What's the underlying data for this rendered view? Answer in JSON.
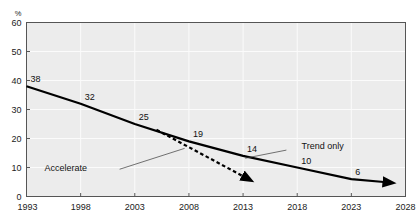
{
  "chart_data": {
    "type": "line",
    "title": "",
    "subtitle": "",
    "xlabel": "",
    "ylabel": "%",
    "ylim": [
      0,
      60
    ],
    "xlim": [
      1993,
      2028
    ],
    "grid": true,
    "legend_position": "inline-annotations",
    "yticks": [
      "0",
      "10",
      "20",
      "30",
      "40",
      "50",
      "60"
    ],
    "ytick_values": [
      0,
      10,
      20,
      30,
      40,
      50,
      60
    ],
    "xticks": [
      "1993",
      "1998",
      "2003",
      "2008",
      "2013",
      "2018",
      "2023",
      "2028"
    ],
    "xtick_values": [
      1993,
      1998,
      2003,
      2008,
      2013,
      2018,
      2023,
      2028
    ],
    "series": [
      {
        "name": "Trend only",
        "style": "solid",
        "color": "#000000",
        "arrow_end": true,
        "x": [
          1993,
          1998,
          2003,
          2008,
          2013,
          2018,
          2023,
          2026
        ],
        "values": [
          38,
          32,
          25,
          19,
          14,
          10,
          6,
          5
        ],
        "point_labels": [
          "38",
          "32",
          "25",
          "19",
          "14",
          "10",
          "6",
          ""
        ]
      },
      {
        "name": "Accelerate",
        "style": "dashed",
        "color": "#000000",
        "arrow_end": true,
        "x": [
          2005,
          2013
        ],
        "values": [
          23,
          7
        ],
        "point_labels": [
          "",
          ""
        ]
      }
    ],
    "annotations": [
      {
        "text": "Trend only",
        "target_series": "Trend only",
        "label_x": 2018.4,
        "label_y": 17.5,
        "leader_from_x": 2017.0,
        "leader_from_y": 16.0,
        "leader_to_x": 2013.2,
        "leader_to_y": 13.2
      },
      {
        "text": "Accelerate",
        "target_series": "Accelerate",
        "label_x": 1998.6,
        "label_y": 9.8,
        "leader_from_x": 2001.6,
        "leader_from_y": 9.4,
        "leader_to_x": 2007.6,
        "leader_to_y": 16.6
      }
    ],
    "colors": {
      "plot_background": "#ececec",
      "gridline": "#fbfbfb",
      "axis": "#555555",
      "series_line": "#000000",
      "page_background": "#ffffff"
    }
  }
}
